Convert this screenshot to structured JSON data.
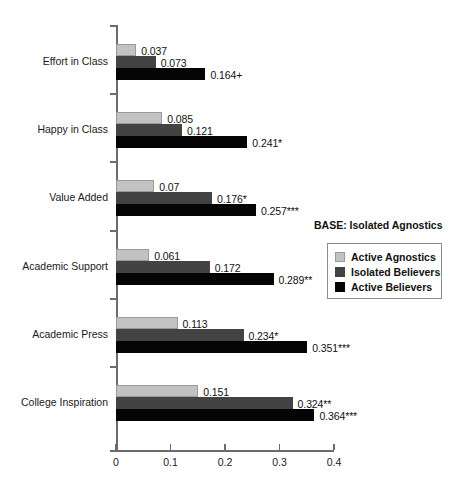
{
  "chart_data": {
    "type": "bar",
    "orientation": "horizontal",
    "title": "",
    "xlabel": "",
    "ylabel": "",
    "xlim": [
      0,
      0.4
    ],
    "xticks": [
      "0",
      "0.1",
      "0.2",
      "0.3",
      "0.4"
    ],
    "xtick_values": [
      0,
      0.1,
      0.2,
      0.3,
      0.4
    ],
    "grid": false,
    "legend_position": "right-middle",
    "base_note": "BASE: Isolated Agnostics",
    "categories": [
      "Effort in Class",
      "Happy in Class",
      "Value Added",
      "Academic Support",
      "Academic Press",
      "College Inspiration"
    ],
    "series": [
      {
        "name": "Active Agnostics",
        "color": "#c2c2c2",
        "values": [
          0.037,
          0.085,
          0.07,
          0.061,
          0.113,
          0.151
        ],
        "labels": [
          "0.037",
          "0.085",
          "0.07",
          "0.061",
          "0.113",
          "0.151"
        ]
      },
      {
        "name": "Isolated Believers",
        "color": "#434343",
        "values": [
          0.073,
          0.121,
          0.176,
          0.172,
          0.234,
          0.324
        ],
        "labels": [
          "0.073",
          "0.121",
          "0.176*",
          "0.172",
          "0.234*",
          "0.324**"
        ]
      },
      {
        "name": "Active Believers",
        "color": "#050505",
        "values": [
          0.164,
          0.241,
          0.257,
          0.289,
          0.351,
          0.364
        ],
        "labels": [
          "0.164+",
          "0.241*",
          "0.257***",
          "0.289**",
          "0.351***",
          "0.364***"
        ]
      }
    ]
  }
}
